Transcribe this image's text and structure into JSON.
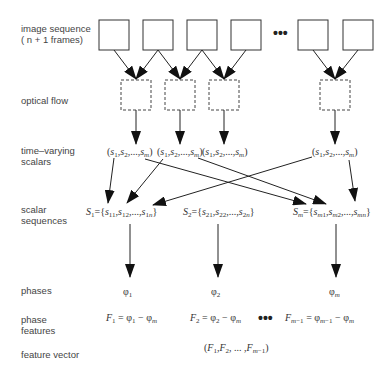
{
  "row_labels": {
    "image_sequence": "image sequence",
    "image_sequence_sub": "( n + 1 frames)",
    "optical_flow": "optical flow",
    "time_varying": "time–varying",
    "time_varying_2": "scalars",
    "scalar_seq": "scalar",
    "scalar_seq_2": "sequences",
    "phases": "phases",
    "phase_features": "phase",
    "phase_features_2": "features",
    "feature_vector": "feature vector"
  },
  "frames_count_visible": 6,
  "ellipsis": "•••",
  "time_varying_scalars": [
    "(s1,s2,...,sm)",
    "(s1,s2,...,sm)",
    "(s1,s2,...,sm)",
    "(s1,s2,...,sm)"
  ],
  "scalar_sequences": [
    "S1={s11,s12,...,s1n}",
    "S2={s21,s22,...,s2n}",
    "Sm={sm1,sm2,...,smn}"
  ],
  "phases": [
    "φ1",
    "φ2",
    "φm"
  ],
  "phase_features": [
    "F1 = φ1 − φm",
    "F2 = φ2 − φm",
    "Fm−1 = φm−1 − φm"
  ],
  "feature_vector": "(F1,F2, ... ,Fm−1)"
}
